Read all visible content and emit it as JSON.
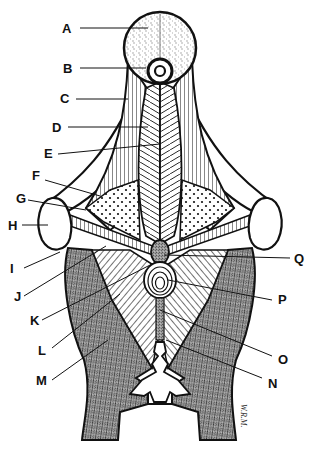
{
  "figure": {
    "type": "anatomical line drawing",
    "signature": "W.R.M.",
    "colors": {
      "ink": "#111111",
      "stipple_gray": "#8a8a8a",
      "background": "#ffffff"
    }
  },
  "labels": [
    {
      "id": "A",
      "text": "A"
    },
    {
      "id": "B",
      "text": "B"
    },
    {
      "id": "C",
      "text": "C"
    },
    {
      "id": "D",
      "text": "D"
    },
    {
      "id": "E",
      "text": "E"
    },
    {
      "id": "F",
      "text": "F"
    },
    {
      "id": "G",
      "text": "G"
    },
    {
      "id": "H",
      "text": "H"
    },
    {
      "id": "I",
      "text": "I"
    },
    {
      "id": "J",
      "text": "J"
    },
    {
      "id": "K",
      "text": "K"
    },
    {
      "id": "L",
      "text": "L"
    },
    {
      "id": "M",
      "text": "M"
    },
    {
      "id": "N",
      "text": "N"
    },
    {
      "id": "O",
      "text": "O"
    },
    {
      "id": "P",
      "text": "P"
    },
    {
      "id": "Q",
      "text": "Q"
    }
  ]
}
